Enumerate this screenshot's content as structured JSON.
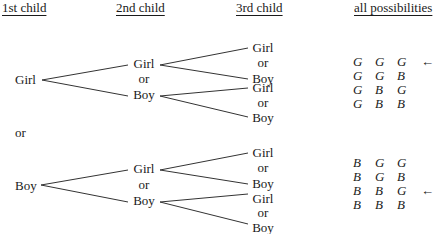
{
  "headers": {
    "first": "1st child",
    "second": "2nd child",
    "third": "3rd child",
    "possibilities": "all possibilities"
  },
  "tree": {
    "girl_branch": {
      "first": "Girl",
      "second": [
        "Girl",
        "or",
        "Boy"
      ],
      "third": [
        "Girl",
        "or",
        "Boy",
        "Girl",
        "or",
        "Boy"
      ]
    },
    "separator": "or",
    "boy_branch": {
      "first": "Boy",
      "second": [
        "Girl",
        "or",
        "Boy"
      ],
      "third": [
        "Girl",
        "or",
        "Boy",
        "Girl",
        "or",
        "Boy"
      ]
    }
  },
  "possibilities": {
    "top": [
      [
        "G",
        "G",
        "G"
      ],
      [
        "G",
        "G",
        "B"
      ],
      [
        "G",
        "B",
        "G"
      ],
      [
        "G",
        "B",
        "B"
      ]
    ],
    "bottom": [
      [
        "B",
        "G",
        "G"
      ],
      [
        "B",
        "G",
        "B"
      ],
      [
        "B",
        "B",
        "G"
      ],
      [
        "B",
        "B",
        "B"
      ]
    ],
    "arrow": "←",
    "marked_rows": [
      "GGG",
      "BBG"
    ]
  }
}
